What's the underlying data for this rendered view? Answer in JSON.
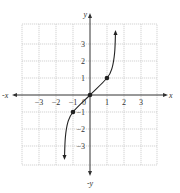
{
  "chart_data": {
    "type": "line",
    "title": "",
    "xlabel": "x",
    "ylabel": "y",
    "neg_xlabel": "-x",
    "neg_ylabel": "-y",
    "xlim": [
      -4,
      4
    ],
    "ylim": [
      -4,
      4
    ],
    "grid": true,
    "x_ticks": [
      -3,
      -2,
      -1,
      1,
      2,
      3
    ],
    "y_ticks": [
      3,
      2,
      1,
      -1,
      -2,
      -3
    ],
    "origin_label": "0",
    "series": [
      {
        "name": "curve",
        "description": "Increasing S-shaped curve (cube-root-like inverse), steep near ends, arrows at both ends",
        "points": [
          {
            "x": -1.5,
            "y": -3.7
          },
          {
            "x": -1.45,
            "y": -2.5
          },
          {
            "x": -1.3,
            "y": -1.6
          },
          {
            "x": -1,
            "y": -1
          },
          {
            "x": 0,
            "y": 0
          },
          {
            "x": 1,
            "y": 1
          },
          {
            "x": 1.3,
            "y": 1.6
          },
          {
            "x": 1.45,
            "y": 2.5
          },
          {
            "x": 1.5,
            "y": 3.7
          }
        ],
        "marked_points": [
          {
            "x": -1,
            "y": -1
          },
          {
            "x": 0,
            "y": 0
          },
          {
            "x": 1,
            "y": 1
          }
        ],
        "end_arrows": true
      }
    ]
  },
  "colors": {
    "grid": "#c8c8c8",
    "axis": "#333333",
    "curve": "#222222"
  }
}
